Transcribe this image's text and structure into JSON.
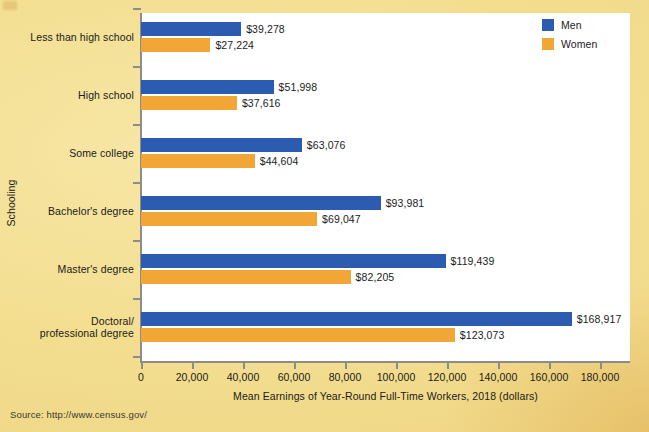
{
  "chart_data": {
    "type": "bar",
    "orientation": "horizontal",
    "title": "",
    "xlabel": "Mean Earnings of Year-Round Full-Time Workers, 2018 (dollars)",
    "ylabel": "Schooling",
    "categories": [
      "Less than high school",
      "High school",
      "Some college",
      "Bachelor's degree",
      "Master's degree",
      "Doctoral/\nprofessional degree"
    ],
    "series": [
      {
        "name": "Men",
        "color": "#2C5CB0",
        "values": [
          39278,
          51998,
          63076,
          93981,
          119439,
          168917
        ],
        "labels": [
          "$39,278",
          "$51,998",
          "$63,076",
          "$93,981",
          "$119,439",
          "$168,917"
        ]
      },
      {
        "name": "Women",
        "color": "#F2A635",
        "values": [
          27224,
          37616,
          44604,
          69047,
          82205,
          123073
        ],
        "labels": [
          "$27,224",
          "$37,616",
          "$44,604",
          "$69,047",
          "$82,205",
          "$123,073"
        ]
      }
    ],
    "xlim": [
      0,
      180000
    ],
    "xticks": [
      0,
      20000,
      40000,
      60000,
      80000,
      100000,
      120000,
      140000,
      160000,
      180000
    ],
    "xtick_labels": [
      "0",
      "20,000",
      "40,000",
      "60,000",
      "80,000",
      "100,000",
      "120,000",
      "140,000",
      "160,000",
      "180,000"
    ],
    "grid": false,
    "legend_position": "top-right",
    "plot_background": "#FFFFFF",
    "page_background": "#F3DF92"
  },
  "legend": {
    "items": [
      {
        "label": "Men",
        "color": "#2C5CB0"
      },
      {
        "label": "Women",
        "color": "#F2A635"
      }
    ]
  },
  "axes": {
    "x_title": "Mean Earnings of Year-Round Full-Time Workers, 2018 (dollars)",
    "y_title": "Schooling"
  },
  "footer": {
    "source": "Source: http://www.census.gov/"
  }
}
